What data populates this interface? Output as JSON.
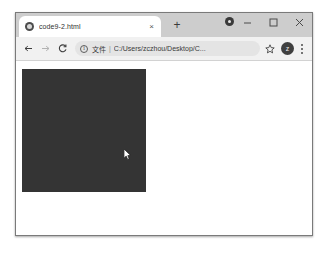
{
  "window": {
    "controls": {
      "minimize_label": "Minimize",
      "maximize_label": "Maximize",
      "close_label": "Close"
    }
  },
  "tabstrip": {
    "tabs": [
      {
        "title": "code9-2.html",
        "favicon": "globe-icon",
        "close_label": "×",
        "active": true
      }
    ],
    "new_tab_label": "+",
    "dot_icon": "circle-dot-icon"
  },
  "toolbar": {
    "back_label": "←",
    "forward_label": "→",
    "reload_label": "C",
    "omnibox": {
      "info_icon": "info-icon",
      "scheme_label": "文件",
      "separator": "|",
      "url": "C:/Users/zczhou/Desktop/C...",
      "placeholder": "地址栏"
    },
    "bookmark_icon": "star-icon",
    "profile_initial": "z",
    "menu_icon": "kebab-menu-icon"
  },
  "page": {
    "canvas": {
      "name": "dark-canvas",
      "fill_color": "#343434",
      "width": 124,
      "height": 123
    },
    "cursor": "arrow-cursor"
  },
  "colors": {
    "tabstrip_bg": "#cdcdcd",
    "toolbar_bg": "#f1f1f1",
    "omnibox_bg": "#e4e4e4",
    "canvas": "#343434",
    "page_bg": "#ffffff"
  }
}
